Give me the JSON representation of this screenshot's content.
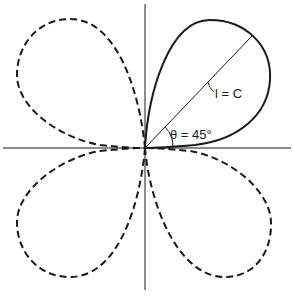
{
  "diagram": {
    "type": "polar-four-lobe-pattern",
    "axes": {
      "horizontal": true,
      "vertical": true
    },
    "lobes": [
      {
        "position": "upper-right",
        "style": "solid"
      },
      {
        "position": "upper-left",
        "style": "dashed"
      },
      {
        "position": "lower-left",
        "style": "dashed"
      },
      {
        "position": "lower-right",
        "style": "dashed"
      }
    ],
    "labels": {
      "radius_label": "l = C",
      "angle_label": "θ = 45°"
    },
    "colors": {
      "stroke": "#1a1a1a",
      "background": "#ffffff"
    }
  }
}
